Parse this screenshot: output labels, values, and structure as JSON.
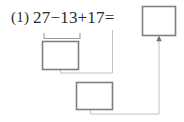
{
  "page": {
    "width": 184,
    "height": 122,
    "background_color": "#ffffff",
    "kind": "math-worksheet-step-diagram"
  },
  "problem": {
    "number_label": "(1)",
    "expression": "27−13+17=",
    "operands": [
      27,
      13,
      17
    ],
    "operators": [
      "−",
      "+"
    ],
    "text_color": "#2b2b2b"
  },
  "answer_box": {
    "name": "final-answer-box",
    "value": "",
    "placeholder": "",
    "x": 142,
    "y": 6,
    "width": 34,
    "height": 30,
    "border_color": "#808080"
  },
  "step_boxes": [
    {
      "name": "step-1-answer-box",
      "label": "step-1",
      "value": "",
      "x": 42,
      "y": 41,
      "width": 37,
      "height": 29,
      "border_color": "#808080"
    },
    {
      "name": "step-2-answer-box",
      "label": "step-2",
      "value": "",
      "x": 76,
      "y": 82,
      "width": 37,
      "height": 28,
      "border_color": "#808080"
    }
  ],
  "bracket": {
    "name": "grouping-bracket-27-minus-13",
    "covers": "27−13",
    "x1": 44,
    "x2": 80,
    "y_top": 33,
    "y_bottom": 39,
    "color": "#9a9a9a"
  },
  "connectors": [
    {
      "name": "connector-step1-to-plus17",
      "color": "#bcbcbc",
      "points": "60,70 60,73 112,73 112,30",
      "arrow": false
    },
    {
      "name": "connector-step2-to-answer",
      "color": "#bcbcbc",
      "points": "90,110 90,114 159,114 159,39",
      "arrow": true,
      "arrow_color": "#6f6f6f"
    }
  ],
  "colors": {
    "box_border": "#808080",
    "connector": "#bcbcbc",
    "bracket": "#9a9a9a",
    "text": "#2b2b2b",
    "arrow": "#6f6f6f"
  }
}
